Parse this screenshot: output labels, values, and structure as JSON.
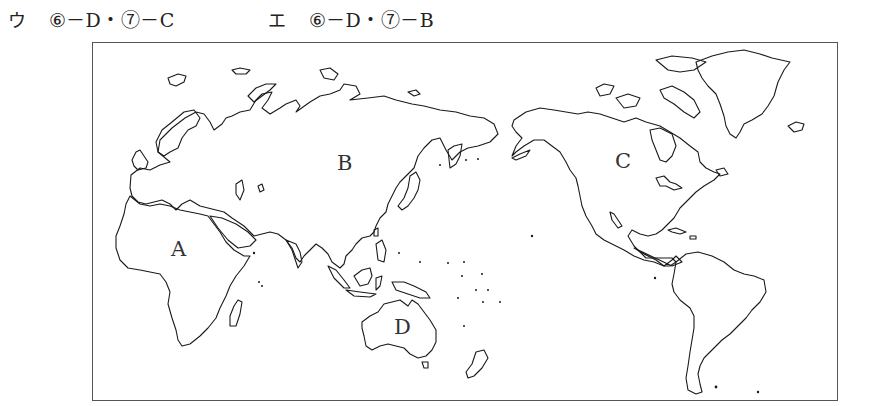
{
  "answer_choices": [
    {
      "kana": "ウ",
      "text": "⑥－D・⑦－C"
    },
    {
      "kana": "エ",
      "text": "⑥－D・⑦－B"
    }
  ],
  "map": {
    "type": "world outline map (Pacific-centered)",
    "region_labels": {
      "africa": "A",
      "eurasia": "B",
      "north_america": "C",
      "australia": "D"
    }
  }
}
